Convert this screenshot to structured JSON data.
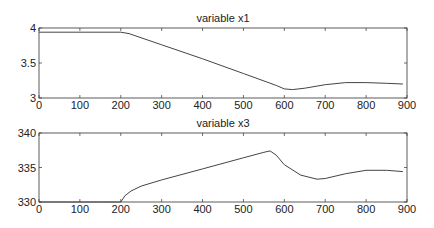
{
  "chart_data": [
    {
      "type": "line",
      "title": "variable x1",
      "xlabel": "",
      "ylabel": "",
      "xlim": [
        0,
        900
      ],
      "ylim": [
        3,
        4
      ],
      "xticks": [
        "0",
        "100",
        "200",
        "300",
        "400",
        "500",
        "600",
        "700",
        "800",
        "900"
      ],
      "yticks": [
        "3",
        "3.5",
        "4"
      ],
      "grid": false,
      "series": [
        {
          "name": "x1",
          "x": [
            0,
            100,
            200,
            220,
            300,
            400,
            500,
            580,
            600,
            620,
            650,
            700,
            750,
            800,
            850,
            890
          ],
          "values": [
            3.94,
            3.94,
            3.94,
            3.92,
            3.76,
            3.56,
            3.35,
            3.18,
            3.13,
            3.12,
            3.14,
            3.19,
            3.22,
            3.22,
            3.21,
            3.2
          ]
        }
      ]
    },
    {
      "type": "line",
      "title": "variable x3",
      "xlabel": "",
      "ylabel": "",
      "xlim": [
        0,
        900
      ],
      "ylim": [
        330,
        340
      ],
      "xticks": [
        "0",
        "100",
        "200",
        "300",
        "400",
        "500",
        "600",
        "700",
        "800",
        "900"
      ],
      "yticks": [
        "330",
        "335",
        "340"
      ],
      "grid": false,
      "series": [
        {
          "name": "x3",
          "x": [
            0,
            100,
            200,
            210,
            225,
            250,
            300,
            400,
            500,
            550,
            565,
            580,
            600,
            640,
            680,
            700,
            750,
            800,
            850,
            890
          ],
          "values": [
            330,
            330,
            330,
            330.9,
            331.6,
            332.3,
            333.2,
            334.8,
            336.4,
            337.2,
            337.4,
            336.8,
            335.4,
            333.9,
            333.3,
            333.4,
            334.1,
            334.6,
            334.6,
            334.4
          ]
        }
      ]
    }
  ]
}
